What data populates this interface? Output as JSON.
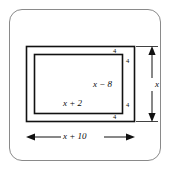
{
  "figure": {
    "kind": "geometry-diagram",
    "colors": {
      "stroke": "#111111",
      "frame": "#8a8a8a",
      "background": "#ffffff"
    },
    "border_labels": {
      "top": "4",
      "right_upper": "4",
      "right_lower": "4",
      "bottom": "4"
    },
    "inner_labels": {
      "height_expression": "x − 8",
      "width_expression": "x + 2"
    },
    "dimensions": {
      "horizontal": {
        "label": "x + 10",
        "arrow": "double-headed"
      },
      "vertical": {
        "label": "x",
        "arrow": "double-headed"
      }
    }
  }
}
